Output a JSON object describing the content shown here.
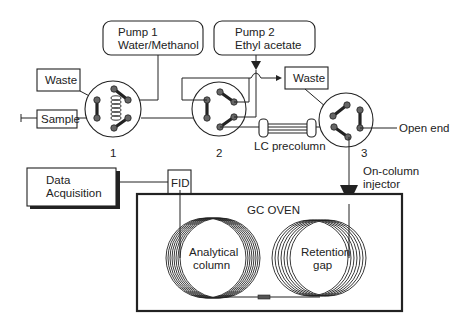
{
  "diagram": {
    "pumps": [
      {
        "id": "pump1",
        "line1": "Pump 1",
        "line2": "Water/Methanol"
      },
      {
        "id": "pump2",
        "line1": "Pump 2",
        "line2": "Ethyl acetate"
      }
    ],
    "boxes": {
      "waste_left": "Waste",
      "waste_right": "Waste",
      "sample": "Sample",
      "data_acq_line1": "Data",
      "data_acq_line2": "Acquisition",
      "fid": "FID"
    },
    "valves": [
      {
        "id": "valve1",
        "label": "1"
      },
      {
        "id": "valve2",
        "label": "2"
      },
      {
        "id": "valve3",
        "label": "3"
      }
    ],
    "labels": {
      "lc_precolumn": "LC precolumn",
      "open_end": "Open end",
      "injector_line1": "On-column",
      "injector_line2": "injector",
      "gc_oven": "GC OVEN",
      "analytical_line1": "Analytical",
      "analytical_line2": "column",
      "retention_line1": "Retention",
      "retention_line2": "gap"
    },
    "colors": {
      "stroke": "#222222",
      "port_fill": "#666666",
      "background": "#ffffff"
    }
  }
}
